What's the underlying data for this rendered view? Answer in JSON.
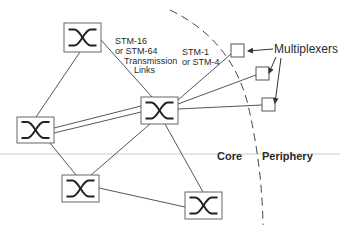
{
  "diagram": {
    "type": "network-topology",
    "colors": {
      "line": "#555555",
      "box_border": "#666666",
      "box_fill": "#ffffff",
      "text": "#2a2a2a",
      "divider": "#cccccc",
      "boundary": "#444444"
    },
    "labels": {
      "core_link_l1": "STM-16",
      "core_link_l2": "or STM-64",
      "core_link_l3": "Transmission",
      "core_link_l4": "Links",
      "access_link_l1": "STM-1",
      "access_link_l2": "or STM-4",
      "multiplexers": "Multiplexers",
      "core": "Core",
      "periphery": "Periphery"
    },
    "nodes": [
      {
        "id": "switch-top",
        "kind": "cross-connect",
        "icon": "cross-connect-icon"
      },
      {
        "id": "switch-left",
        "kind": "cross-connect",
        "icon": "cross-connect-icon"
      },
      {
        "id": "switch-center",
        "kind": "cross-connect",
        "icon": "cross-connect-icon"
      },
      {
        "id": "switch-bottom-left",
        "kind": "cross-connect",
        "icon": "cross-connect-icon"
      },
      {
        "id": "switch-bottom-right",
        "kind": "cross-connect",
        "icon": "cross-connect-icon"
      },
      {
        "id": "mux-1",
        "kind": "multiplexer"
      },
      {
        "id": "mux-2",
        "kind": "multiplexer"
      },
      {
        "id": "mux-3",
        "kind": "multiplexer"
      }
    ],
    "edges": [
      {
        "from": "switch-top",
        "to": "switch-left"
      },
      {
        "from": "switch-top",
        "to": "switch-center"
      },
      {
        "from": "switch-left",
        "to": "switch-center",
        "style": "double"
      },
      {
        "from": "switch-left",
        "to": "switch-bottom-left"
      },
      {
        "from": "switch-center",
        "to": "switch-bottom-left"
      },
      {
        "from": "switch-center",
        "to": "switch-bottom-right"
      },
      {
        "from": "switch-bottom-left",
        "to": "switch-bottom-right"
      },
      {
        "from": "switch-center",
        "to": "mux-1"
      },
      {
        "from": "switch-center",
        "to": "mux-2"
      },
      {
        "from": "switch-center",
        "to": "mux-3"
      }
    ]
  }
}
